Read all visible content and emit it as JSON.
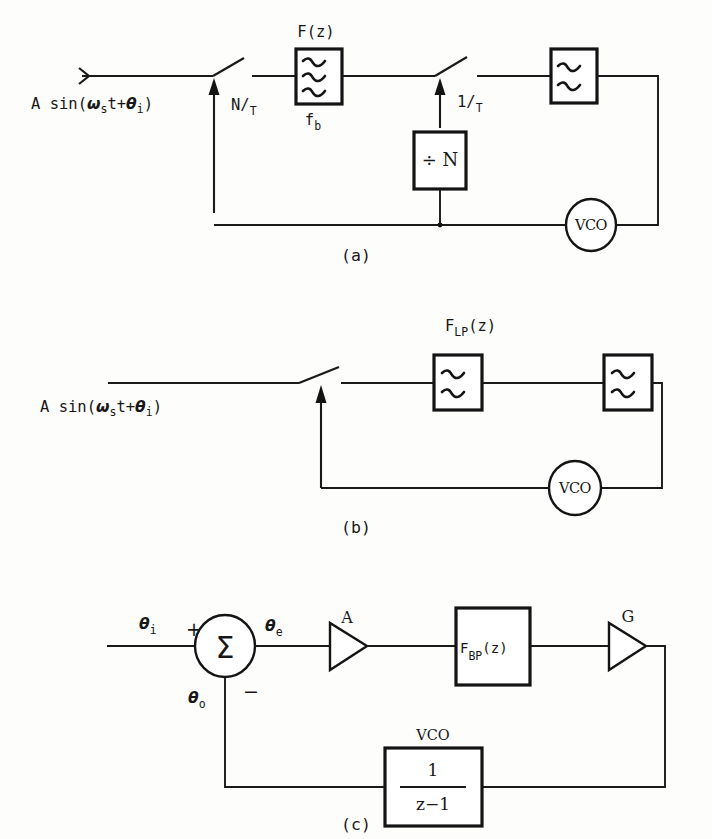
{
  "figure": {
    "type": "block-diagram-set"
  },
  "panel_a": {
    "caption": "(a)",
    "input_label": {
      "prefix": "A sin(",
      "omega": "ω",
      "sub_s": "s",
      "mid": "t+",
      "theta": "θ",
      "sub_i": "i",
      "suffix": ")"
    },
    "clock1_label_num": "N/",
    "clock1_label_den": "T",
    "clock2_label_num": "1/",
    "clock2_label_den": "T",
    "filter_label": "F(z)",
    "filter_sub_label_main": "f",
    "filter_sub_label_sub": "b",
    "divider_label": "÷ N",
    "vco_label": "VCO"
  },
  "panel_b": {
    "caption": "(b)",
    "input_label": {
      "prefix": "A sin(",
      "omega": "ω",
      "sub_s": "s",
      "mid": "t+",
      "theta": "θ",
      "sub_i": "i",
      "suffix": ")"
    },
    "filter_label_main": "F",
    "filter_label_sub": "LP",
    "filter_label_tail": "(z)",
    "vco_label": "VCO"
  },
  "panel_c": {
    "caption": "(c)",
    "theta_in_main": "θ",
    "theta_in_sub": "i",
    "theta_err_main": "θ",
    "theta_err_sub": "e",
    "theta_out_main": "θ",
    "theta_out_sub": "o",
    "plus_sign": "+",
    "minus_sign": "−",
    "sum_symbol": "Σ",
    "gain_a": "A",
    "gain_g": "G",
    "filter_label_main": "F",
    "filter_label_sub": "BP",
    "filter_label_tail": "(z)",
    "vco_label": "VCO",
    "vco_numerator": "1",
    "vco_denominator": "z−1"
  },
  "colors": {
    "ink": "#171717",
    "paper": "#fdfdfc"
  }
}
